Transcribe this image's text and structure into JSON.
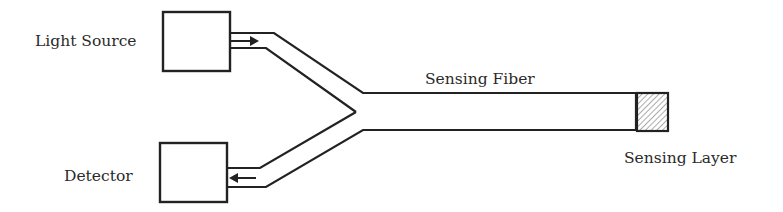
{
  "diagram": {
    "type": "fiber-optic-sensor-schematic",
    "components": {
      "light_source": {
        "label": "Light Source"
      },
      "detector": {
        "label": "Detector"
      },
      "sensing_fiber": {
        "label": "Sensing Fiber"
      },
      "sensing_layer": {
        "label": "Sensing Layer",
        "pattern": "hatched"
      }
    },
    "connections": [
      {
        "from": "light_source",
        "to": "sensing_fiber",
        "arrow": "toward-fiber"
      },
      {
        "from": "sensing_fiber",
        "to": "detector",
        "arrow": "toward-detector"
      }
    ],
    "colors": {
      "stroke": "#222222",
      "hatch": "#888888",
      "background": "#ffffff"
    }
  }
}
